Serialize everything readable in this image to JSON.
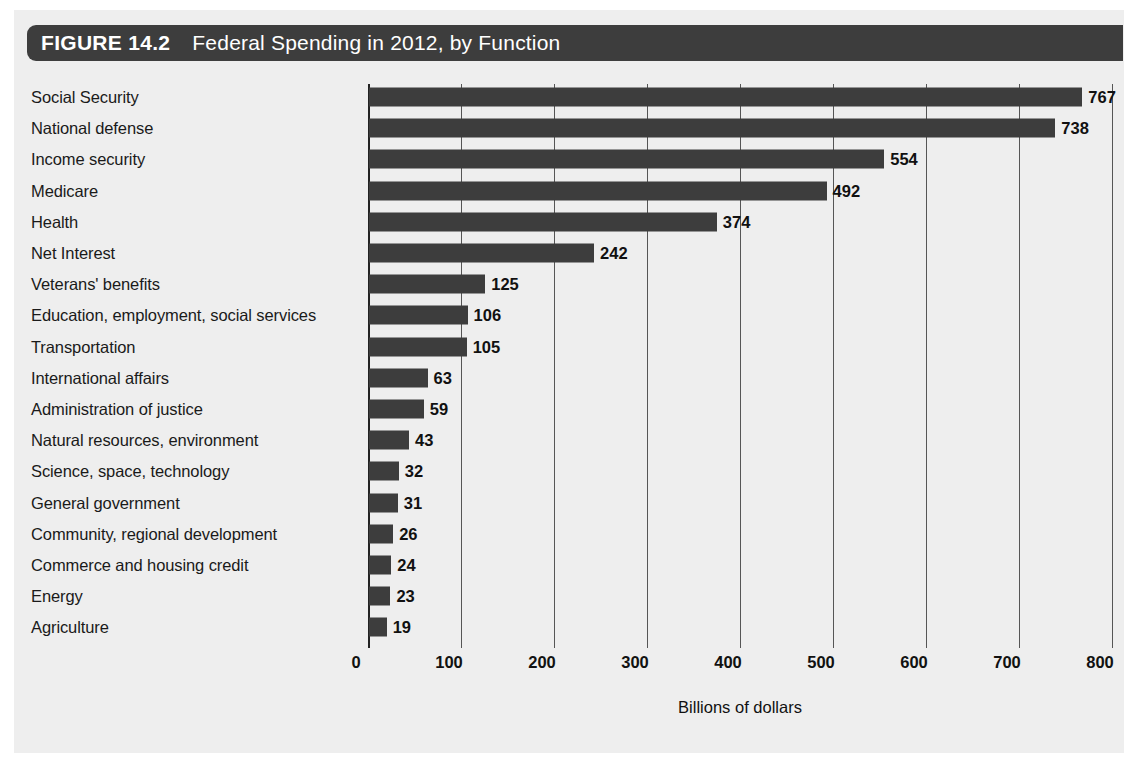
{
  "figure": {
    "number_label": "FIGURE 14.2",
    "title": "Federal Spending in 2012, by Function"
  },
  "colors": {
    "banner_bg": "#3d3d3d",
    "bar_fill": "#3d3d3d",
    "panel_bg": "#eeeeee",
    "text": "#1a1a1a",
    "gridline": "#555555"
  },
  "chart_data": {
    "type": "bar",
    "orientation": "horizontal",
    "title": "Federal Spending in 2012, by Function",
    "subtitle": "",
    "xlabel": "Billions of dollars",
    "ylabel": "",
    "xlim": [
      0,
      800
    ],
    "xticks": [
      0,
      100,
      200,
      300,
      400,
      500,
      600,
      700,
      800
    ],
    "xtick_labels": [
      "0",
      "100",
      "200",
      "300",
      "400",
      "500",
      "600",
      "700",
      "800"
    ],
    "grid": "vertical",
    "legend": "none",
    "categories": [
      "Social Security",
      "National defense",
      "Income security",
      "Medicare",
      "Health",
      "Net Interest",
      "Veterans' benefits",
      "Education, employment, social services",
      "Transportation",
      "International affairs",
      "Administration of justice",
      "Natural resources, environment",
      "Science, space, technology",
      "General government",
      "Community, regional development",
      "Commerce and housing credit",
      "Energy",
      "Agriculture"
    ],
    "values": [
      767,
      738,
      554,
      492,
      374,
      242,
      125,
      106,
      105,
      63,
      59,
      43,
      32,
      31,
      26,
      24,
      23,
      19
    ],
    "value_labels": [
      "767",
      "738",
      "554",
      "492",
      "374",
      "242",
      "125",
      "106",
      "105",
      "63",
      "59",
      "43",
      "32",
      "31",
      "26",
      "24",
      "23",
      "19"
    ]
  }
}
